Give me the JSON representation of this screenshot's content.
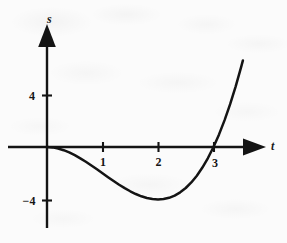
{
  "figure": {
    "background_color": "#fbfbfb",
    "ink_color": "#141414"
  },
  "axes": {
    "x_axis_name": "t",
    "y_axis_name": "s",
    "x_tick_labels": [
      "1",
      "2",
      "3"
    ],
    "y_tick_labels": [
      "4",
      "-4"
    ]
  },
  "labels": {
    "t": "t",
    "s": "s",
    "one": "1",
    "two": "2",
    "three": "3",
    "four": "4",
    "minus_four": "−4"
  },
  "chart_data": {
    "type": "line",
    "title": "",
    "xlabel": "t",
    "ylabel": "s",
    "equation": "s = t^3 - 3t^2",
    "grid": false,
    "legend": "none",
    "xlim": [
      -0.7,
      4.3
    ],
    "ylim": [
      -6.5,
      7.3
    ],
    "xticks": [
      1,
      2,
      3
    ],
    "xticklabels": [
      "1",
      "2",
      "3"
    ],
    "yticks": [
      4,
      -4
    ],
    "yticklabels": [
      "4",
      "-4"
    ],
    "x_axis_range_drawn": [
      -0.7,
      3.93
    ],
    "y_axis_range_drawn": [
      -6.3,
      7.2
    ],
    "series": [
      {
        "name": "s(t)",
        "x": [
          0.0,
          0.1,
          0.2,
          0.3,
          0.4,
          0.5,
          0.6,
          0.7,
          0.8,
          0.9,
          1.0,
          1.1,
          1.2,
          1.3,
          1.4,
          1.5,
          1.6,
          1.7,
          1.8,
          1.9,
          2.0,
          2.1,
          2.2,
          2.3,
          2.4,
          2.5,
          2.6,
          2.7,
          2.8,
          2.9,
          3.0,
          3.1,
          3.2,
          3.3,
          3.4,
          3.5,
          3.53
        ],
        "y": [
          0.0,
          -0.029,
          -0.112,
          -0.243,
          -0.416,
          -0.625,
          -0.864,
          -1.127,
          -1.408,
          -1.701,
          -2.0,
          -2.299,
          -2.592,
          -2.873,
          -3.136,
          -3.375,
          -3.584,
          -3.757,
          -3.888,
          -3.971,
          -4.0,
          -3.969,
          -3.872,
          -3.703,
          -3.456,
          -3.125,
          -2.704,
          -2.187,
          -1.568,
          -0.841,
          0.0,
          0.961,
          2.048,
          3.267,
          4.624,
          6.125,
          6.6
        ]
      }
    ],
    "annotations": [
      {
        "text": "root at t = 0",
        "t": 0,
        "s": 0
      },
      {
        "text": "local minimum (2, -4)",
        "t": 2,
        "s": -4
      },
      {
        "text": "root at t = 3",
        "t": 3,
        "s": 0
      }
    ]
  }
}
